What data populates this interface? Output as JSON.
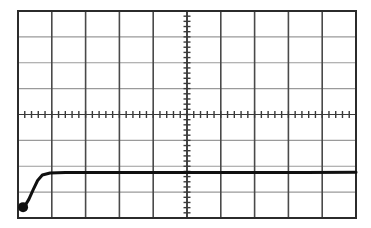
{
  "figure": {
    "kind": "oscilloscope-graticule-photo",
    "background_color": "#ffffff",
    "width": 371,
    "height": 228
  },
  "graticule": {
    "left": 18,
    "top": 11,
    "right": 356,
    "bottom": 218,
    "columns": 10,
    "rows": 8,
    "border_color": "#2b2b2b",
    "border_width": 2.0,
    "vertical_line_color": "#4a4a4a",
    "vertical_line_width": 1.6,
    "horizontal_line_color": "#9a9a9a",
    "horizontal_line_width": 1.2,
    "center_x": 187,
    "center_y": 114.5,
    "minor_ticks_per_division": 5,
    "tick_color": "#3a3a3a",
    "tick_width": 1.4,
    "tick_length": 7
  },
  "chart_data": {
    "type": "line",
    "title": "",
    "subtitle": "",
    "xlabel": "",
    "ylabel": "",
    "grid": true,
    "legend": "none",
    "axis_units": "divisions",
    "xlim": [
      0,
      10
    ],
    "ylim": [
      0,
      8
    ],
    "xticks": [
      0,
      1,
      2,
      3,
      4,
      5,
      6,
      7,
      8,
      9,
      10
    ],
    "yticks": [
      0,
      1,
      2,
      3,
      4,
      5,
      6,
      7,
      8
    ],
    "xtick_labels": [
      "",
      "",
      "",
      "",
      "",
      "",
      "",
      "",
      "",
      "",
      ""
    ],
    "ytick_labels": [
      "",
      "",
      "",
      "",
      "",
      "",
      "",
      "",
      ""
    ],
    "series": [
      {
        "name": "trace",
        "color": "#101010",
        "line_width": 3.0,
        "x": [
          0.15,
          0.22,
          0.32,
          0.45,
          0.58,
          0.72,
          0.95,
          1.4,
          2.5,
          4.0,
          5.5,
          7.0,
          8.5,
          10.0
        ],
        "y": [
          0.42,
          0.5,
          0.72,
          1.1,
          1.45,
          1.66,
          1.74,
          1.76,
          1.76,
          1.76,
          1.76,
          1.76,
          1.76,
          1.77
        ]
      }
    ],
    "markers": [
      {
        "name": "start-blob",
        "x": 0.15,
        "y": 0.42,
        "shape": "filled-circle",
        "radius_px": 5,
        "color": "#101010"
      }
    ],
    "annotations": []
  },
  "trace": {
    "flat_level_divisions": 1.76,
    "start_point_divisions": [
      0.15,
      0.42
    ],
    "rise_start_divisions": 0.22,
    "rise_end_divisions": 0.95
  }
}
